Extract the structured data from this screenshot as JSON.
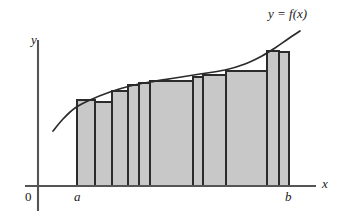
{
  "figure": {
    "type": "math-diagram",
    "background_color": "#ffffff"
  },
  "labels": {
    "y_axis": "y",
    "x_axis": "x",
    "origin": "0",
    "lower_bound": "a",
    "upper_bound": "b",
    "curve": "y = f(x)"
  },
  "colors": {
    "rect_fill": "#c8c8c8",
    "rect_stroke": "#2b2b2b",
    "curve_stroke": "#2b2b2b",
    "axis_stroke": "#555555",
    "text": "#1a1a1a"
  },
  "chart_data": {
    "type": "area",
    "title": "",
    "subtitle": "",
    "xlabel": "x",
    "ylabel": "y",
    "grid": false,
    "legend_position": "inline-curve-label",
    "annotations": [
      {
        "text": "y = f(x)",
        "x": 268,
        "y": 14
      },
      {
        "text": "a",
        "x": 77,
        "y": 196
      },
      {
        "text": "b",
        "x": 289,
        "y": 196
      },
      {
        "text": "0",
        "x": 30,
        "y": 196
      }
    ],
    "axes": {
      "x_axis_y_px": 186,
      "y_axis_x_px": 38,
      "x_axis_from_px": 25,
      "x_axis_to_px": 316,
      "y_axis_from_px": 40,
      "y_axis_to_px": 211
    },
    "interval": {
      "a_px": 77,
      "b_px": 289,
      "n_rectangles": 10
    },
    "rectangles": [
      {
        "index": 1,
        "x0": 77,
        "x1": 95,
        "top": 100,
        "bottom": 186
      },
      {
        "index": 2,
        "x0": 95,
        "x1": 112,
        "top": 102,
        "bottom": 186
      },
      {
        "index": 3,
        "x0": 112,
        "x1": 128,
        "top": 91,
        "bottom": 186
      },
      {
        "index": 4,
        "x0": 128,
        "x1": 139,
        "top": 85,
        "bottom": 186
      },
      {
        "index": 5,
        "x0": 139,
        "x1": 150,
        "top": 83,
        "bottom": 186
      },
      {
        "index": 6,
        "x0": 150,
        "x1": 193,
        "top": 81,
        "bottom": 186
      },
      {
        "index": 7,
        "x0": 193,
        "x1": 203,
        "top": 77,
        "bottom": 186
      },
      {
        "index": 8,
        "x0": 203,
        "x1": 226,
        "top": 75,
        "bottom": 186
      },
      {
        "index": 9,
        "x0": 226,
        "x1": 267,
        "top": 71,
        "bottom": 186
      },
      {
        "index": 10,
        "x0": 267,
        "x1": 279,
        "top": 51,
        "bottom": 186
      },
      {
        "index": 11,
        "x0": 279,
        "x1": 289,
        "top": 52,
        "bottom": 186
      }
    ],
    "curve_points": [
      {
        "x": 53,
        "y": 131
      },
      {
        "x": 63,
        "y": 119
      },
      {
        "x": 75,
        "y": 108
      },
      {
        "x": 90,
        "y": 100
      },
      {
        "x": 110,
        "y": 92
      },
      {
        "x": 130,
        "y": 86
      },
      {
        "x": 150,
        "y": 82
      },
      {
        "x": 175,
        "y": 78
      },
      {
        "x": 200,
        "y": 74
      },
      {
        "x": 225,
        "y": 70
      },
      {
        "x": 245,
        "y": 64
      },
      {
        "x": 262,
        "y": 56
      },
      {
        "x": 275,
        "y": 48
      },
      {
        "x": 288,
        "y": 39
      },
      {
        "x": 300,
        "y": 31
      }
    ]
  }
}
